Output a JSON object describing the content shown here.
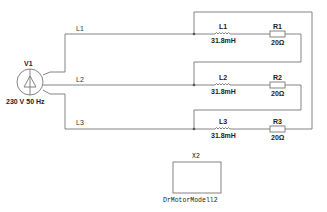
{
  "diagram": {
    "type": "circuit-schematic",
    "source": {
      "name": "V1",
      "rating": "230 V 50 Hz"
    },
    "lines": [
      {
        "label": "L1"
      },
      {
        "label": "L2"
      },
      {
        "label": "L3"
      }
    ],
    "branches": [
      {
        "inductor": {
          "name": "L1",
          "value": "31.8mH"
        },
        "resistor": {
          "name": "R1",
          "value": "20Ω"
        }
      },
      {
        "inductor": {
          "name": "L2",
          "value": "31.8mH"
        },
        "resistor": {
          "name": "R2",
          "value": "20Ω"
        }
      },
      {
        "inductor": {
          "name": "L3",
          "value": "31.8mH"
        },
        "resistor": {
          "name": "R3",
          "value": "20Ω"
        }
      }
    ],
    "component": {
      "name": "X2",
      "model": "DrMotorModell2"
    },
    "colors": {
      "wire": "#777777",
      "text": "#333333",
      "background": "#ffffff"
    }
  }
}
